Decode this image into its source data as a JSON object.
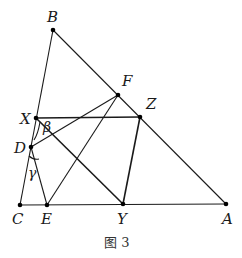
{
  "figure": {
    "caption": "图 3",
    "points": [
      {
        "name": "B",
        "label": "B",
        "x": 53,
        "y": 30,
        "lx": 47,
        "ly": 22
      },
      {
        "name": "F",
        "label": "F",
        "x": 118,
        "y": 95,
        "lx": 122,
        "ly": 86
      },
      {
        "name": "X",
        "label": "X",
        "x": 36,
        "y": 118,
        "lx": 20,
        "ly": 124
      },
      {
        "name": "Z",
        "label": "Z",
        "x": 140,
        "y": 117,
        "lx": 146,
        "ly": 109
      },
      {
        "name": "D",
        "label": "D",
        "x": 31,
        "y": 147,
        "lx": 14,
        "ly": 153
      },
      {
        "name": "C",
        "label": "C",
        "x": 20,
        "y": 205,
        "lx": 12,
        "ly": 224
      },
      {
        "name": "E",
        "label": "E",
        "x": 47,
        "y": 205,
        "lx": 41,
        "ly": 224
      },
      {
        "name": "Y",
        "label": "Y",
        "x": 123,
        "y": 204,
        "lx": 117,
        "ly": 224
      },
      {
        "name": "A",
        "label": "A",
        "x": 226,
        "y": 204,
        "lx": 222,
        "ly": 224
      }
    ],
    "angles": [
      {
        "name": "beta",
        "label": "β",
        "x": 43,
        "y": 132
      },
      {
        "name": "gamma",
        "label": "γ",
        "x": 28,
        "y": 178
      }
    ],
    "segments": [
      [
        "B",
        "C"
      ],
      [
        "B",
        "A"
      ],
      [
        "C",
        "A"
      ],
      [
        "X",
        "Z"
      ],
      [
        "Z",
        "Y"
      ],
      [
        "X",
        "Y"
      ],
      [
        "D",
        "F"
      ],
      [
        "E",
        "F"
      ],
      [
        "D",
        "E"
      ]
    ]
  }
}
